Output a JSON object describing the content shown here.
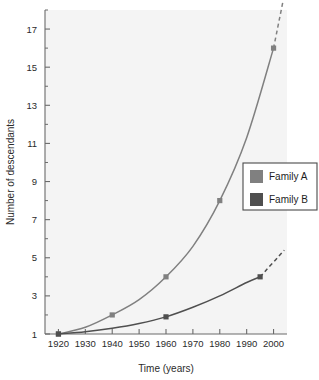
{
  "chart_data": {
    "type": "line",
    "title": "",
    "xlabel": "Time (years)",
    "ylabel": "Number of descendants",
    "xlim": [
      1915,
      2005
    ],
    "ylim": [
      1,
      18
    ],
    "xticks": [
      1920,
      1930,
      1940,
      1950,
      1960,
      1970,
      1980,
      1990,
      2000
    ],
    "xticklabels": [
      "1920",
      "1930",
      "1940",
      "1950",
      "1960",
      "1970",
      "1980",
      "1990",
      "2000"
    ],
    "yticks": [
      1,
      3,
      5,
      7,
      9,
      11,
      13,
      15,
      17
    ],
    "yticklabels": [
      "1",
      "3",
      "5",
      "7",
      "9",
      "11",
      "13",
      "15",
      "17"
    ],
    "y_minor_ticks": [
      2,
      4,
      6,
      8,
      10,
      12,
      14,
      16,
      18
    ],
    "grid": false,
    "legend_position": "right-middle",
    "series": [
      {
        "name": "Family A",
        "color": "#808080",
        "marker": "square",
        "x": [
          1920,
          1930,
          1940,
          1950,
          1960,
          1970,
          1980,
          1990,
          2000
        ],
        "y": [
          1,
          1.35,
          2,
          2.8,
          4,
          5.6,
          8,
          11.3,
          16
        ],
        "marked_points": [
          {
            "x": 1920,
            "y": 1
          },
          {
            "x": 1940,
            "y": 2
          },
          {
            "x": 1960,
            "y": 4
          },
          {
            "x": 1980,
            "y": 8
          },
          {
            "x": 2000,
            "y": 16
          }
        ],
        "extrapolated": {
          "style": "dashed",
          "x": [
            2000,
            2005
          ],
          "y": [
            16,
            19.5
          ]
        }
      },
      {
        "name": "Family B",
        "color": "#4f4f4f",
        "marker": "square",
        "x": [
          1920,
          1930,
          1940,
          1950,
          1960,
          1970,
          1980,
          1990,
          1995
        ],
        "y": [
          1,
          1.12,
          1.3,
          1.55,
          1.9,
          2.4,
          3.0,
          3.7,
          4.0
        ],
        "marked_points": [
          {
            "x": 1920,
            "y": 1
          },
          {
            "x": 1960,
            "y": 1.9
          },
          {
            "x": 1995,
            "y": 4
          }
        ],
        "extrapolated": {
          "style": "dashed",
          "x": [
            1995,
            2004
          ],
          "y": [
            4.0,
            5.4
          ]
        }
      }
    ]
  },
  "legend": {
    "entries": [
      {
        "label": "Family A",
        "color": "#808080"
      },
      {
        "label": "Family B",
        "color": "#4f4f4f"
      }
    ]
  },
  "axes": {
    "x_title": "Time (years)",
    "y_title": "Number of descendants"
  },
  "colors": {
    "plot_background": "#f4f4f4",
    "page_background": "#ffffff",
    "axis": "#6b6b6b",
    "text": "#2b2b2b",
    "family_a": "#808080",
    "family_b": "#4f4f4f",
    "legend_border": "#4a4a4a"
  }
}
